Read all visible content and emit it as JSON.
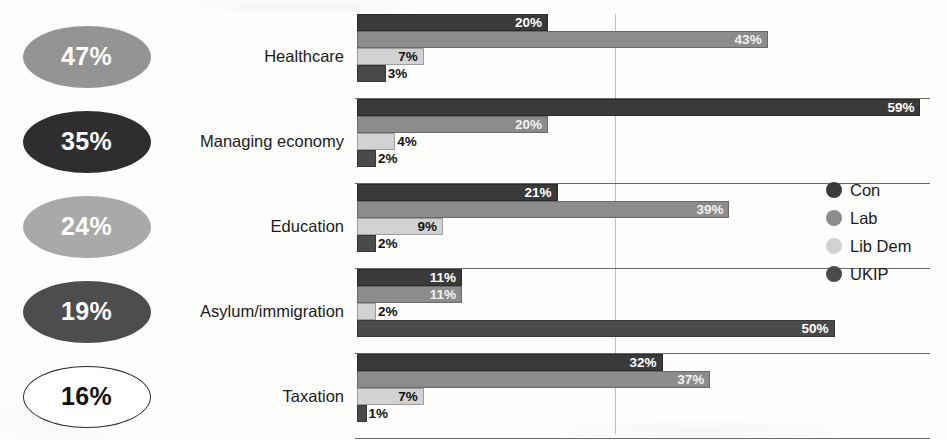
{
  "chart_data": {
    "type": "bar",
    "orientation": "horizontal",
    "title": "",
    "xlabel": "",
    "ylabel": "",
    "xlim": [
      0,
      62
    ],
    "grid": true,
    "gridline_values": [
      27
    ],
    "legend_position": "right",
    "categories": [
      "Healthcare",
      "Managing economy",
      "Education",
      "Asylum/immigration",
      "Taxation"
    ],
    "series": [
      {
        "name": "Con",
        "color": "#3a3a3a",
        "label_color": "#ffffff",
        "values": [
          20,
          59,
          21,
          11,
          32
        ]
      },
      {
        "name": "Lab",
        "color": "#8c8c8c",
        "label_color": "#f2f2f2",
        "values": [
          43,
          20,
          39,
          11,
          37
        ]
      },
      {
        "name": "Lib Dem",
        "color": "#d2d2d2",
        "label_color": "#121212",
        "values": [
          7,
          4,
          9,
          2,
          7
        ]
      },
      {
        "name": "UKIP",
        "color": "#4a4a4a",
        "label_color": "#ffffff",
        "values": [
          3,
          2,
          2,
          50,
          1
        ]
      }
    ],
    "value_suffix": "%",
    "summary_bubbles": [
      {
        "category": "Healthcare",
        "value": "47%",
        "fill": "#949494",
        "text_color": "#ffffff",
        "border": "none"
      },
      {
        "category": "Managing economy",
        "value": "35%",
        "fill": "#2e2e2e",
        "text_color": "#ffffff",
        "border": "none"
      },
      {
        "category": "Education",
        "value": "24%",
        "fill": "#a9a9a9",
        "text_color": "#ffffff",
        "border": "none"
      },
      {
        "category": "Asylum/immigration",
        "value": "19%",
        "fill": "#4d4d4d",
        "text_color": "#ffffff",
        "border": "none"
      },
      {
        "category": "Taxation",
        "value": "16%",
        "fill": "#ffffff",
        "text_color": "#111111",
        "border": "#2a2a2a"
      }
    ]
  }
}
